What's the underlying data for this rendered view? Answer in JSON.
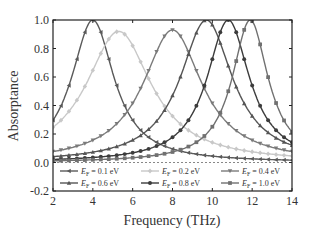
{
  "chart_data": {
    "type": "line",
    "title": "",
    "xlabel": "Frequency (THz)",
    "ylabel": "Absorptance",
    "xlim": [
      2,
      14
    ],
    "ylim": [
      -0.2,
      1.0
    ],
    "xticks": [
      "2",
      "4",
      "6",
      "8",
      "10",
      "12",
      "14"
    ],
    "yticks": [
      "-0.2",
      "0.0",
      "0.2",
      "0.4",
      "0.6",
      "0.8",
      "1.0"
    ],
    "grid": false,
    "reference_line": {
      "y": 0.0,
      "style": "dashed"
    },
    "legend_position": "inside-bottom",
    "series": [
      {
        "name": "E_F = 0.1 eV",
        "marker": "triangle-left",
        "color": "#5a5a5a",
        "peak_x": 4.0,
        "peak_y": 1.0,
        "width": 1.3,
        "base": 0.0
      },
      {
        "name": "E_F = 0.2 eV",
        "marker": "diamond",
        "color": "#c8c8c8",
        "peak_x": 5.3,
        "peak_y": 0.92,
        "width": 2.0,
        "base": 0.0
      },
      {
        "name": "E_F = 0.4 eV",
        "marker": "triangle-down",
        "color": "#7a7a7a",
        "peak_x": 8.0,
        "peak_y": 0.93,
        "width": 1.8,
        "base": 0.0
      },
      {
        "name": "E_F = 0.6 eV",
        "marker": "triangle-up",
        "color": "#555555",
        "peak_x": 9.7,
        "peak_y": 1.0,
        "width": 1.6,
        "base": 0.0
      },
      {
        "name": "E_F = 0.8 eV",
        "marker": "circle",
        "color": "#3c3c3c",
        "peak_x": 10.8,
        "peak_y": 1.0,
        "width": 1.3,
        "base": 0.0
      },
      {
        "name": "E_F = 1.0 eV",
        "marker": "square",
        "color": "#707070",
        "peak_x": 11.9,
        "peak_y": 1.0,
        "width": 1.1,
        "base": 0.0
      }
    ]
  },
  "legend": {
    "items": [
      {
        "sym": "E",
        "sub": "F",
        "text": " = 0.1 eV"
      },
      {
        "sym": "E",
        "sub": "F",
        "text": " = 0.2 eV"
      },
      {
        "sym": "E",
        "sub": "F",
        "text": " = 0.4 eV"
      },
      {
        "sym": "E",
        "sub": "F",
        "text": " = 0.6 eV"
      },
      {
        "sym": "E",
        "sub": "F",
        "text": " = 0.8 eV"
      },
      {
        "sym": "E",
        "sub": "F",
        "text": " = 1.0 eV"
      }
    ]
  }
}
